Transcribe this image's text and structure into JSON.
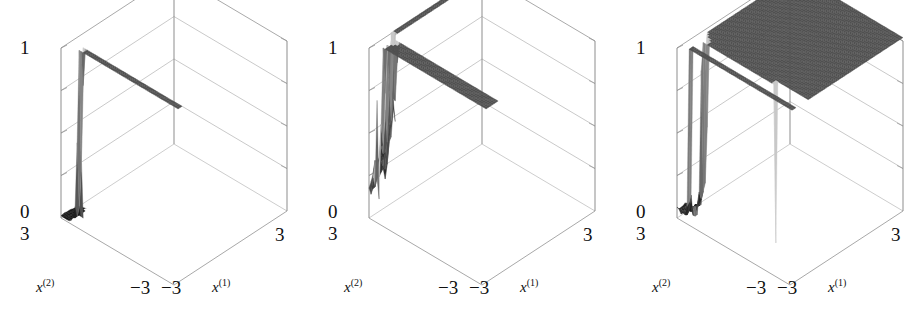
{
  "figure": {
    "background_color": "#ffffff",
    "panel_count": 3,
    "axis_line_color": "#8d8d8d",
    "surface_dark_color": "#0a0a0a",
    "surface_light_color": "#b9b9b9"
  },
  "labels": {
    "z_max": "1",
    "z_min": "0",
    "y_near": "3",
    "y_far": "−3",
    "x_near": "−3",
    "x_far": "3",
    "x1_var": "x",
    "x1_sup": "(1)",
    "x2_var": "x",
    "x2_sup": "(2)"
  },
  "chart_data": {
    "type": "surface",
    "title": "",
    "xlabel": "x(1)",
    "ylabel": "x(2)",
    "zlabel": "",
    "xlim": [
      -3,
      3
    ],
    "ylim": [
      -3,
      3
    ],
    "zlim": [
      0,
      1
    ],
    "xticks": [
      -3,
      3
    ],
    "yticks": [
      -3,
      3
    ],
    "zticks": [
      0,
      1
    ],
    "grid": true,
    "gridlines_z": [
      0.25,
      0.5,
      0.75,
      1.0
    ],
    "legend": "none",
    "panels": [
      {
        "index": 1,
        "name": "clean-gaussian-peak",
        "description": "Flat near-zero surface with a single tall narrow central peak",
        "noise_amplitude": 0.01,
        "peaks": [
          {
            "x": 0.0,
            "y": 0.0,
            "height": 1.0,
            "width": 0.22
          }
        ]
      },
      {
        "index": 2,
        "name": "high-noise-many-peaks",
        "description": "Rough rugged surface with many spurious peaks; the true central peak is tallest",
        "noise_amplitude": 0.22,
        "peaks": [
          {
            "x": 0.0,
            "y": 0.0,
            "height": 1.0,
            "width": 0.22
          },
          {
            "x": -1.9,
            "y": 0.6,
            "height": 0.55,
            "width": 0.3
          },
          {
            "x": -1.2,
            "y": -0.4,
            "height": 0.52,
            "width": 0.28
          },
          {
            "x": -0.6,
            "y": 1.1,
            "height": 0.48,
            "width": 0.26
          },
          {
            "x": 0.7,
            "y": -0.9,
            "height": 0.5,
            "width": 0.27
          },
          {
            "x": 1.5,
            "y": 0.3,
            "height": 0.62,
            "width": 0.3
          },
          {
            "x": 2.1,
            "y": -1.4,
            "height": 0.45,
            "width": 0.28
          },
          {
            "x": -2.4,
            "y": -1.6,
            "height": 0.38,
            "width": 0.3
          },
          {
            "x": 1.0,
            "y": 1.7,
            "height": 0.4,
            "width": 0.26
          },
          {
            "x": 2.5,
            "y": 1.2,
            "height": 0.42,
            "width": 0.28
          }
        ]
      },
      {
        "index": 3,
        "name": "low-noise-single-peak",
        "description": "Mildly noisy floor with one dominant central peak and a small secondary bump",
        "noise_amplitude": 0.07,
        "peaks": [
          {
            "x": 0.0,
            "y": 0.0,
            "height": 1.0,
            "width": 0.2
          },
          {
            "x": 1.6,
            "y": -0.3,
            "height": 0.22,
            "width": 0.22
          }
        ]
      }
    ]
  }
}
